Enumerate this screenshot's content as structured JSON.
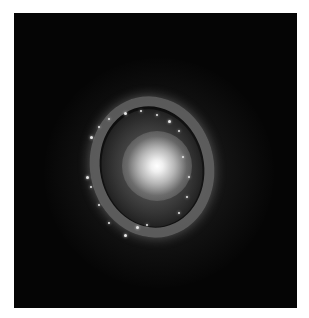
{
  "image": {
    "subject": "spiral galaxy with bright nucleus and star-forming ring",
    "palette": {
      "background": "#ffffff",
      "sky": "#050505",
      "core": "#ffffff",
      "ring": "#969696"
    },
    "clusters": [
      {
        "x": 62,
        "y": 110,
        "s": 3
      },
      {
        "x": 70,
        "y": 100,
        "s": 2
      },
      {
        "x": 80,
        "y": 92,
        "s": 2
      },
      {
        "x": 96,
        "y": 86,
        "s": 3
      },
      {
        "x": 112,
        "y": 84,
        "s": 2
      },
      {
        "x": 128,
        "y": 88,
        "s": 2
      },
      {
        "x": 140,
        "y": 94,
        "s": 3
      },
      {
        "x": 150,
        "y": 104,
        "s": 2
      },
      {
        "x": 58,
        "y": 150,
        "s": 3
      },
      {
        "x": 62,
        "y": 160,
        "s": 2
      },
      {
        "x": 70,
        "y": 178,
        "s": 2
      },
      {
        "x": 80,
        "y": 196,
        "s": 2
      },
      {
        "x": 96,
        "y": 208,
        "s": 3
      },
      {
        "x": 108,
        "y": 200,
        "s": 3
      },
      {
        "x": 118,
        "y": 198,
        "s": 2
      },
      {
        "x": 154,
        "y": 130,
        "s": 2
      },
      {
        "x": 160,
        "y": 150,
        "s": 2
      },
      {
        "x": 158,
        "y": 170,
        "s": 2
      },
      {
        "x": 150,
        "y": 186,
        "s": 2
      }
    ]
  }
}
